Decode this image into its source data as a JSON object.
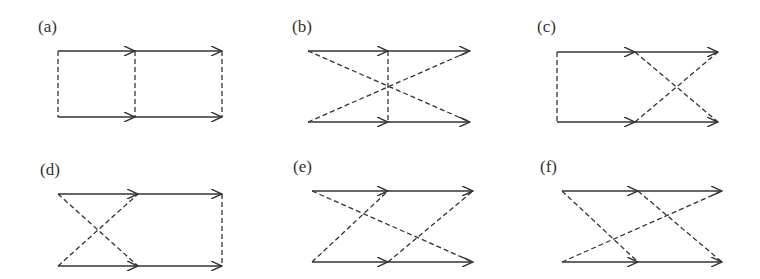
{
  "figure": {
    "colors": {
      "line": "#333333",
      "background": "#ffffff"
    },
    "panels": [
      {
        "id": "a",
        "label": "(a)",
        "label_pos": [
          38,
          32
        ],
        "top_y": 51,
        "bottom_y": 117,
        "x": [
          58,
          135,
          222
        ],
        "dashed": [
          [
            "TL",
            "BL"
          ],
          [
            "TM",
            "BM"
          ],
          [
            "TR",
            "BR"
          ]
        ]
      },
      {
        "id": "b",
        "label": "(b)",
        "label_pos": [
          292,
          32
        ],
        "top_y": 51,
        "bottom_y": 122,
        "x": [
          308,
          388,
          470
        ],
        "dashed": [
          [
            "TL",
            "BR"
          ],
          [
            "BL",
            "TR"
          ],
          [
            "TM",
            "BM"
          ]
        ]
      },
      {
        "id": "c",
        "label": "(c)",
        "label_pos": [
          537,
          32
        ],
        "top_y": 52,
        "bottom_y": 122,
        "x": [
          557,
          635,
          718
        ],
        "dashed": [
          [
            "TL",
            "BL"
          ],
          [
            "TM",
            "BR"
          ],
          [
            "BM",
            "TR"
          ]
        ]
      },
      {
        "id": "d",
        "label": "(d)",
        "label_pos": [
          40,
          175
        ],
        "top_y": 194,
        "bottom_y": 266,
        "x": [
          58,
          138,
          222
        ],
        "dashed": [
          [
            "TL",
            "BM"
          ],
          [
            "BL",
            "TM"
          ],
          [
            "TR",
            "BR"
          ]
        ]
      },
      {
        "id": "e",
        "label": "(e)",
        "label_pos": [
          293,
          172
        ],
        "top_y": 191,
        "bottom_y": 262,
        "x": [
          312,
          388,
          473
        ],
        "dashed": [
          [
            "TL",
            "BR"
          ],
          [
            "BL",
            "TM"
          ],
          [
            "BM",
            "TR"
          ]
        ]
      },
      {
        "id": "f",
        "label": "(f)",
        "label_pos": [
          540,
          172
        ],
        "top_y": 191,
        "bottom_y": 262,
        "x": [
          562,
          638,
          722
        ],
        "dashed": [
          [
            "TL",
            "BM"
          ],
          [
            "BL",
            "TR"
          ],
          [
            "TM",
            "BR"
          ]
        ]
      }
    ]
  }
}
